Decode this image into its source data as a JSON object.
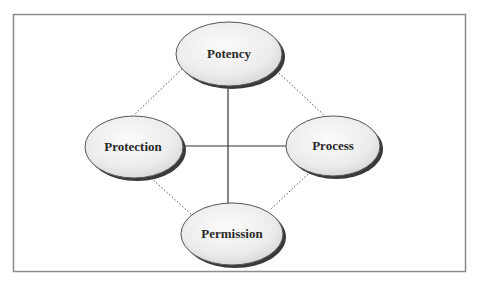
{
  "diagram": {
    "type": "four-node relationship diagram",
    "frame": {
      "x": 13,
      "y": 14,
      "width": 452,
      "height": 257,
      "stroke": "#8c8c8c"
    },
    "colors": {
      "node_fill_light": "#f7f7f7",
      "node_fill_dark": "#d6d6d6",
      "node_stroke": "#555555",
      "node_shadow": "#3a3a3a",
      "solid_line": "#333333",
      "dotted_line": "#555555",
      "label": "#2a2a2a"
    },
    "nodes": [
      {
        "id": "potency",
        "label": "Potency",
        "cx": 229,
        "cy": 54,
        "rx": 53,
        "ry": 32
      },
      {
        "id": "protection",
        "label": "Protection",
        "cx": 134,
        "cy": 147,
        "rx": 49,
        "ry": 31
      },
      {
        "id": "process",
        "label": "Process",
        "cx": 333,
        "cy": 146,
        "rx": 47,
        "ry": 30
      },
      {
        "id": "permission",
        "label": "Permission",
        "cx": 232,
        "cy": 234,
        "rx": 51,
        "ry": 31
      }
    ],
    "edges": [
      {
        "from": "potency",
        "to": "permission",
        "style": "solid"
      },
      {
        "from": "protection",
        "to": "process",
        "style": "solid"
      },
      {
        "from": "potency",
        "to": "protection",
        "style": "dotted"
      },
      {
        "from": "potency",
        "to": "process",
        "style": "dotted"
      },
      {
        "from": "protection",
        "to": "permission",
        "style": "dotted"
      },
      {
        "from": "process",
        "to": "permission",
        "style": "dotted"
      }
    ]
  }
}
